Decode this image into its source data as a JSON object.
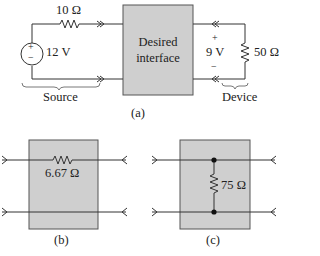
{
  "figure_a": {
    "caption": "(a)",
    "source_resistor": "10 Ω",
    "source_voltage": "12 V",
    "source_label": "Source",
    "interface_label_line1": "Desired",
    "interface_label_line2": "interface",
    "device_voltage": "9 V",
    "device_plus": "+",
    "device_minus": "−",
    "device_resistor": "50 Ω",
    "device_label": "Device",
    "source_plus": "+",
    "source_minus": "−"
  },
  "figure_b": {
    "caption": "(b)",
    "series_resistor": "6.67 Ω"
  },
  "figure_c": {
    "caption": "(c)",
    "shunt_resistor": "75 Ω"
  },
  "colors": {
    "box_fill": "#cfcfcf",
    "box_stroke": "#555555",
    "wire": "#333333"
  }
}
